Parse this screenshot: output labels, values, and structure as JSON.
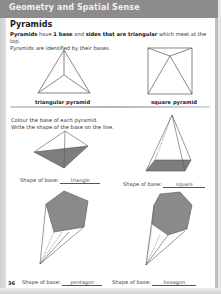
{
  "header": {
    "banner": "Geometry and Spatial Sense"
  },
  "section": {
    "title": "Pyramids",
    "intro_parts": {
      "p1_bold": "Pyramids",
      "p1_text1": " have ",
      "p1_bold2": "1 base",
      "p1_text2": " and ",
      "p1_bold3": "sides that are triangular",
      "p1_text3": " which meet at the top.",
      "line2": "Pyramids are identified by their bases."
    }
  },
  "examples": [
    {
      "caption": "triangular pyramid",
      "icon": "triangular-pyramid-figure"
    },
    {
      "caption": "square pyramid",
      "icon": "square-pyramid-figure"
    }
  ],
  "instructions": {
    "line1": "Colour the base of each pyramid.",
    "line2": "Write the shape of the base on the line."
  },
  "exercises": [
    {
      "label": "Shape of base:",
      "answer": "triangle",
      "base_color": "#7a7a7a"
    },
    {
      "label": "Shape of base:",
      "answer": "square",
      "base_color": "#7a7a7a"
    },
    {
      "label": "Shape of base:",
      "answer": "pentagon",
      "base_color": "#8a8a8a"
    },
    {
      "label": "Shape of base:",
      "answer": "hexagon",
      "base_color": "#8a8a8a"
    }
  ],
  "footer": {
    "page_number": "36"
  },
  "colors": {
    "header_bar": "#8c8c8c",
    "shaded_base": "#7d7d7d",
    "line": "#555555"
  }
}
